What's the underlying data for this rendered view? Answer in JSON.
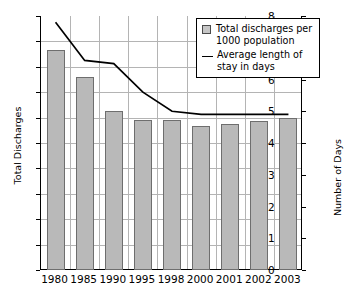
{
  "chart_data": {
    "type": "bar",
    "title": "",
    "xlabel": "",
    "ylabel": "Total Discharges",
    "y2label": "Number of Days",
    "categories": [
      "1980",
      "1985",
      "1990",
      "1995",
      "1998",
      "2000",
      "2001",
      "2002",
      "2003"
    ],
    "ylim": [
      0,
      200
    ],
    "y2lim": [
      0,
      8
    ],
    "yticks": [
      0,
      20,
      40,
      60,
      80,
      100,
      120,
      140,
      160,
      180,
      200
    ],
    "y2ticks": [
      0,
      1,
      2,
      3,
      4,
      5,
      6,
      7,
      8
    ],
    "grid": true,
    "legend_position": "top-right",
    "series": [
      {
        "name": "Total discharges per 1000 population",
        "type": "bar",
        "axis": "left",
        "color": "#b9b9b9",
        "values": [
          173,
          152,
          125,
          118,
          118,
          113,
          115,
          117,
          120
        ]
      },
      {
        "name": "Average length of stay in days",
        "type": "line",
        "axis": "right",
        "color": "#000000",
        "values": [
          7.8,
          6.6,
          6.5,
          5.6,
          5.0,
          4.9,
          4.9,
          4.9,
          4.9
        ]
      }
    ]
  },
  "legend": {
    "bar_label": "Total discharges per 1000 population",
    "line_label": "Average length of stay in days",
    "bar_swatch_icon": "square-swatch-icon",
    "line_swatch_icon": "line-swatch-icon"
  },
  "axes": {
    "left_title": "Total Discharges",
    "right_title": "Number of Days"
  }
}
